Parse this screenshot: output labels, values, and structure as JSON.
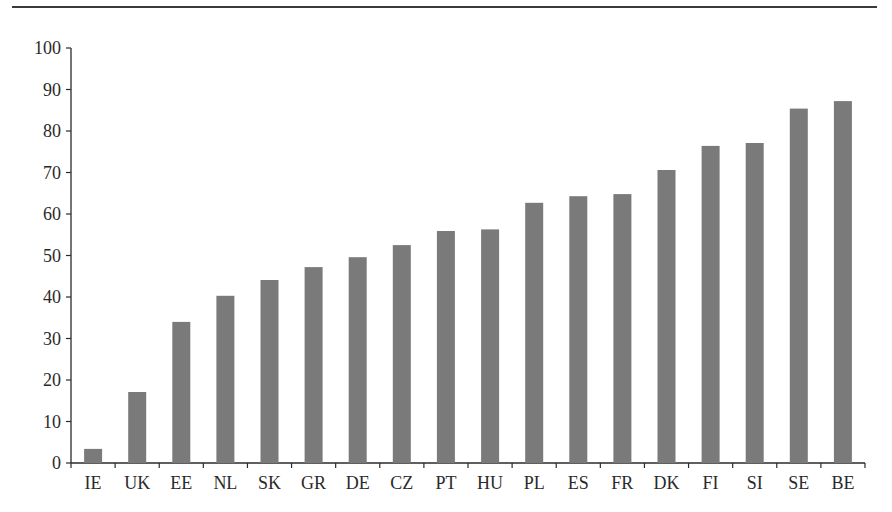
{
  "chart_data": {
    "type": "bar",
    "title": "",
    "xlabel": "",
    "ylabel": "",
    "ylim": [
      0,
      100
    ],
    "yticks": [
      0,
      10,
      20,
      30,
      40,
      50,
      60,
      70,
      80,
      90,
      100
    ],
    "grid": false,
    "legend": null,
    "categories": [
      "IE",
      "UK",
      "EE",
      "NL",
      "SK",
      "GR",
      "DE",
      "CZ",
      "PT",
      "HU",
      "PL",
      "ES",
      "FR",
      "DK",
      "FI",
      "SI",
      "SE",
      "BE"
    ],
    "values": [
      3.4,
      17.1,
      34.0,
      40.3,
      44.1,
      47.2,
      49.6,
      52.5,
      55.9,
      56.3,
      62.7,
      64.3,
      64.8,
      70.6,
      76.4,
      77.1,
      85.4,
      87.2
    ],
    "bar_color": "#7a7a7a"
  },
  "colors": {
    "axis": "#2a2a2a",
    "bar": "#7a7a7a",
    "rule": "#3a3a3a",
    "background": "#ffffff"
  }
}
